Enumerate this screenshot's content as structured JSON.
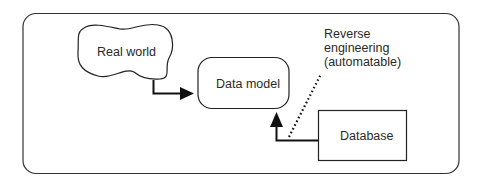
{
  "diagram": {
    "nodes": {
      "real_world": {
        "label": "Real world",
        "shape": "cloud"
      },
      "data_model": {
        "label": "Data model",
        "shape": "rounded-rectangle"
      },
      "database": {
        "label": "Database",
        "shape": "rectangle"
      }
    },
    "edges": [
      {
        "from": "real_world",
        "to": "data_model",
        "style": "solid-arrow"
      },
      {
        "from": "database",
        "to": "data_model",
        "style": "solid-arrow"
      }
    ],
    "annotation": {
      "lines": [
        "Reverse",
        "engineering",
        "(automatable)"
      ],
      "style": "dotted-leader"
    },
    "colors": {
      "stroke": "#1a1a1a",
      "text": "#2a2a2a",
      "background": "#ffffff"
    }
  }
}
